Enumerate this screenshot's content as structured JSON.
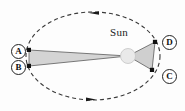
{
  "figure": {
    "sun_label": "Sun",
    "sun_body_label": "S",
    "points": [
      {
        "id": "A",
        "label": "A",
        "x": 29,
        "y": 50,
        "side": "left-upper"
      },
      {
        "id": "B",
        "label": "B",
        "x": 29,
        "y": 66,
        "side": "left-lower"
      },
      {
        "id": "C",
        "label": "C",
        "x": 152,
        "y": 70,
        "side": "right-lower"
      },
      {
        "id": "D",
        "label": "D",
        "x": 155,
        "y": 42,
        "side": "right-upper"
      }
    ],
    "orbit": {
      "type": "ellipse",
      "center_x": 93,
      "center_y": 56,
      "radius_x": 67,
      "radius_y": 44,
      "stroke": "#3a3a3a",
      "dash": "4 3",
      "style": "dashed"
    },
    "sun_position": {
      "x": 128,
      "y": 56,
      "radius": 7
    },
    "sectors": [
      {
        "name": "sector-AB",
        "from": "A",
        "to": "B",
        "fill": "#d4d4d4"
      },
      {
        "name": "sector-CD",
        "from": "D",
        "to": "C",
        "fill": "#cfcfcf"
      }
    ],
    "direction_arrows": [
      {
        "name": "arrow-top",
        "x": 95,
        "y": 12.6,
        "direction": "counterclockwise-left"
      },
      {
        "name": "arrow-bottom",
        "x": 91,
        "y": 99.4,
        "direction": "counterclockwise-right"
      }
    ],
    "colors": {
      "sector_fill": "#d4d4d4",
      "sector_stroke": "#555555",
      "orbit_stroke": "#3a3a3a",
      "sun_fill": "#e6e6e6",
      "point_fill": "#111111",
      "background": "#fdfdfd"
    }
  }
}
